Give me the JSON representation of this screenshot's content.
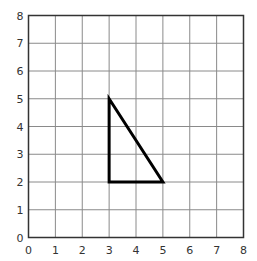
{
  "chart_data": {
    "type": "scatter",
    "title": "",
    "xlabel": "",
    "ylabel": "",
    "xlim": [
      0,
      8
    ],
    "ylim": [
      0,
      8
    ],
    "grid": true,
    "x_ticks": [
      "0",
      "1",
      "2",
      "3",
      "4",
      "5",
      "6",
      "7",
      "8"
    ],
    "y_ticks": [
      "0",
      "1",
      "2",
      "3",
      "4",
      "5",
      "6",
      "7",
      "8"
    ],
    "shape": {
      "name": "triangle",
      "vertices": [
        [
          3,
          5
        ],
        [
          3,
          2
        ],
        [
          5,
          2
        ]
      ],
      "closed": true,
      "stroke": "#000000"
    }
  },
  "colors": {
    "grid": "#8a8a8a",
    "axis": "#333333",
    "shape": "#000000"
  }
}
